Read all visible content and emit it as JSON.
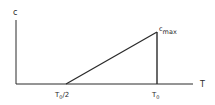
{
  "diagram": {
    "y_axis_label": "c",
    "x_axis_label": "T",
    "peak_label_base": "c",
    "peak_label_sub": "max",
    "tick_labels": [
      {
        "base": "T",
        "sub": "0",
        "suffix": "/2"
      },
      {
        "base": "T",
        "sub": "0",
        "suffix": ""
      }
    ],
    "line_color": "#2a2a2a"
  }
}
